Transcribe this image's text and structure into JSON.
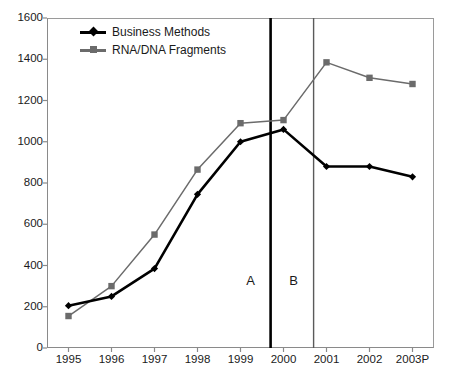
{
  "chart_data": {
    "type": "line",
    "title": "",
    "xlabel": "",
    "ylabel": "",
    "categories": [
      "1995",
      "1996",
      "1997",
      "1998",
      "1999",
      "2000",
      "2001",
      "2002",
      "2003P"
    ],
    "series": [
      {
        "name": "Business Methods",
        "color": "#000000",
        "marker": "diamond",
        "values": [
          205,
          250,
          385,
          745,
          1000,
          1060,
          880,
          880,
          830
        ]
      },
      {
        "name": "RNA/DNA Fragments",
        "color": "#6b6b6b",
        "marker": "square",
        "values": [
          155,
          300,
          550,
          865,
          1090,
          1105,
          1385,
          1310,
          1280
        ]
      }
    ],
    "ylim": [
      0,
      1600
    ],
    "yticks": [
      0,
      200,
      400,
      600,
      800,
      1000,
      1200,
      1400,
      1600
    ],
    "ytick_labels": [
      "0",
      "200",
      "400",
      "600",
      "800",
      "1000",
      "1200",
      "1400",
      "1600"
    ],
    "grid": false,
    "legend_position": "top-left",
    "annotations": [
      {
        "label": "A",
        "type": "vertical-line",
        "x_position": 4.7,
        "color": "#000000",
        "line_width": 2.6
      },
      {
        "label": "B",
        "type": "vertical-line",
        "x_position": 5.7,
        "color": "#5a5a5a",
        "line_width": 1.4
      }
    ]
  },
  "caption": {
    "text": ""
  }
}
